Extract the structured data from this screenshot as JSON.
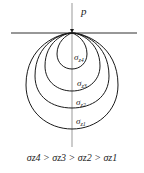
{
  "diagram": {
    "load_label": "p",
    "ground_line": {
      "y": 33,
      "x1": 11,
      "x2": 137
    },
    "axis": {
      "x": 72,
      "y1": 3,
      "y2": 147
    },
    "apex": {
      "x": 72,
      "y": 33
    },
    "isobars": [
      {
        "name": "σz4",
        "symbol": "σ",
        "sub": "z4",
        "bottom": 69,
        "half_width": 15,
        "label_y": 60
      },
      {
        "name": "σz3",
        "symbol": "σ",
        "sub": "z3",
        "bottom": 91,
        "half_width": 27,
        "label_y": 86
      },
      {
        "name": "σz2",
        "symbol": "σ",
        "sub": "z2",
        "bottom": 108,
        "half_width": 37,
        "label_y": 104
      },
      {
        "name": "σz1",
        "symbol": "σ",
        "sub": "z1",
        "bottom": 129,
        "half_width": 46,
        "label_y": 124
      }
    ],
    "caption": "σz4 > σz3 > σz2 > σz1",
    "line_color": "#1a1a1a"
  }
}
